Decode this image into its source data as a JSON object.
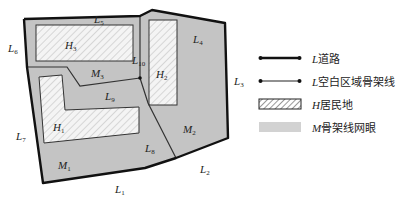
{
  "diagram": {
    "colors": {
      "mesh_fill": "#c4c4c4",
      "road_stroke": "#111111",
      "skeleton_stroke": "#333333",
      "residential_fill": "#f4f4f4",
      "hatch": "#b8b8b8",
      "background": "#ffffff"
    },
    "roads": [
      {
        "id": "L1",
        "label": "L",
        "sub": "1"
      },
      {
        "id": "L2",
        "label": "L",
        "sub": "2"
      },
      {
        "id": "L3",
        "label": "L",
        "sub": "3"
      },
      {
        "id": "L4",
        "label": "L",
        "sub": "4"
      },
      {
        "id": "L5",
        "label": "L",
        "sub": "5"
      },
      {
        "id": "L6",
        "label": "L",
        "sub": "6"
      },
      {
        "id": "L7",
        "label": "L",
        "sub": "7"
      }
    ],
    "skeleton_lines": [
      {
        "id": "L8",
        "label": "L",
        "sub": "8"
      },
      {
        "id": "L9",
        "label": "L",
        "sub": "9"
      },
      {
        "id": "L10",
        "label": "L",
        "sub": "10"
      }
    ],
    "residential": [
      {
        "id": "H1",
        "label": "H",
        "sub": "1"
      },
      {
        "id": "H2",
        "label": "H",
        "sub": "2"
      },
      {
        "id": "H3",
        "label": "H",
        "sub": "3"
      }
    ],
    "meshes": [
      {
        "id": "M1",
        "label": "M",
        "sub": "1"
      },
      {
        "id": "M2",
        "label": "M",
        "sub": "2"
      },
      {
        "id": "M3",
        "label": "M",
        "sub": "3"
      }
    ]
  },
  "legend": {
    "items": [
      {
        "symbol": "road",
        "letter": "L",
        "text": "道路"
      },
      {
        "symbol": "skeleton",
        "letter": "L",
        "text": "空白区域骨架线"
      },
      {
        "symbol": "residential",
        "letter": "H",
        "text": "居民地"
      },
      {
        "symbol": "mesh",
        "letter": "M",
        "text": "骨架线网眼"
      }
    ]
  }
}
